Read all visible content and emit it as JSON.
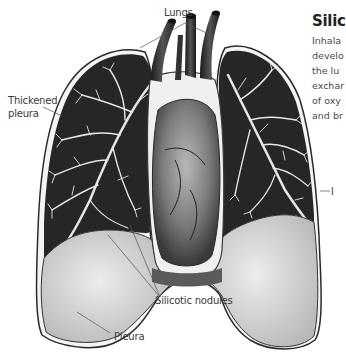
{
  "figure": {
    "title": "Silic",
    "description_lines": [
      "Inhala",
      "develo",
      "the lu",
      "exchar",
      "of oxy",
      "and br"
    ],
    "labels": {
      "lungs": "Lungs",
      "thickened_pleura_line1": "Thickened",
      "thickened_pleura_line2": "pleura",
      "silicotic_nodules": "Silicotic nodules",
      "pleura": "Pleura",
      "right_cut_label": "l"
    },
    "colors": {
      "background": "#ffffff",
      "lung_dark": "#2a2a2a",
      "airway": "#e8e8e8",
      "pleura_fill": "#d6d6d6",
      "heart": "#8a8a8a",
      "leader_line": "#555555"
    }
  }
}
